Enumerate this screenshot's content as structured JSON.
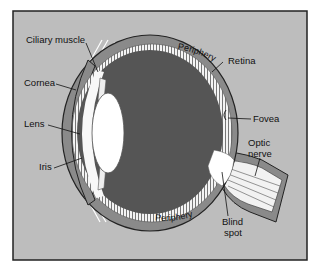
{
  "diagram": {
    "title": "",
    "colors": {
      "background": "#bdbdbd",
      "frame": "#222222",
      "sclera": "#8a8a8a",
      "vitreous": "#555555",
      "retina": "#f2f2f2",
      "lens": "#ffffff",
      "nerve": "#f0f0f0"
    },
    "labels": {
      "ciliary_muscle": "Ciliary muscle",
      "cornea": "Cornea",
      "lens": "Lens",
      "iris": "Iris",
      "retina": "Retina",
      "fovea": "Fovea",
      "optic_nerve_line1": "Optic",
      "optic_nerve_line2": "nerve",
      "blind_spot_line1": "Blind",
      "blind_spot_line2": "spot",
      "periphery_top": "Periphery",
      "periphery_bottom": "Periphery"
    }
  }
}
